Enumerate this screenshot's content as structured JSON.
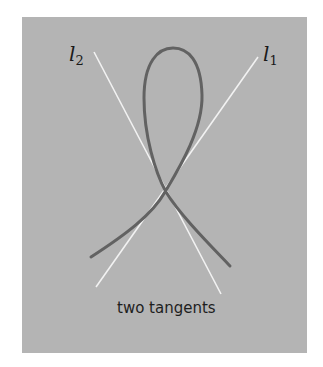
{
  "figure": {
    "labels": {
      "l2": {
        "base": "l",
        "sub": "2"
      },
      "l1": {
        "base": "l",
        "sub": "1"
      }
    },
    "caption": "two tangents",
    "colors": {
      "background": "#b4b4b4",
      "curve": "#626262",
      "tangent_lines": "#f2f2f2",
      "text": "#1e1e1e"
    }
  }
}
